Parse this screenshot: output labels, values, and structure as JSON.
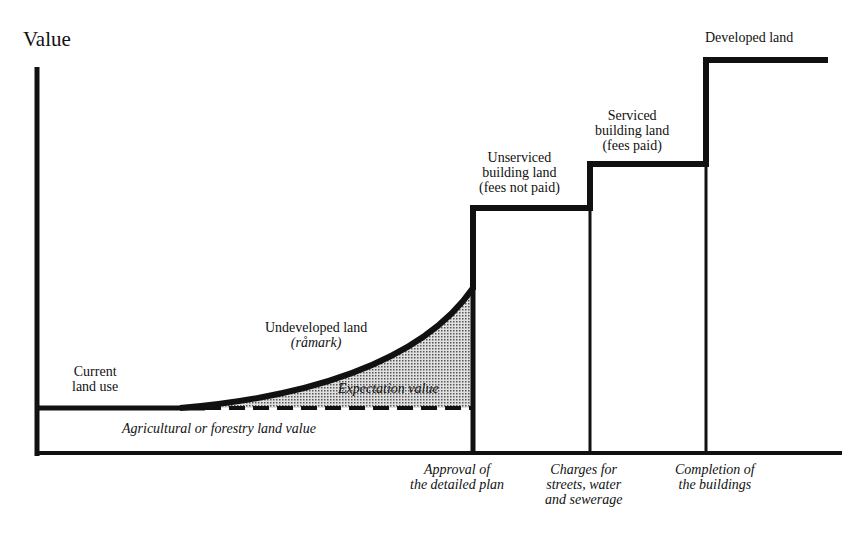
{
  "diagram": {
    "y_axis_label": "Value",
    "stages": [
      {
        "name": "current-land-use",
        "lines": [
          "Current",
          "land use"
        ]
      },
      {
        "name": "undeveloped-land",
        "lines": [
          "Undeveloped land"
        ],
        "sub": "(råmark)"
      },
      {
        "name": "unserviced-building-land",
        "lines": [
          "Unserviced",
          "building land",
          "(fees not paid)"
        ]
      },
      {
        "name": "serviced-building-land",
        "lines": [
          "Serviced",
          "building land",
          "(fees paid)"
        ]
      },
      {
        "name": "developed-land",
        "lines": [
          "Developed land"
        ]
      }
    ],
    "areas": {
      "expectation_value": "Expectation value",
      "agricultural_value": "Agricultural or forestry land value"
    },
    "events": [
      {
        "lines": [
          "Approval of",
          "the detailed plan"
        ]
      },
      {
        "lines": [
          "Charges for",
          "streets, water",
          "and sewerage"
        ]
      },
      {
        "lines": [
          "Completion of",
          "the buildings"
        ]
      }
    ],
    "colors": {
      "line": "#111111",
      "shade": "#bdbdbd",
      "background": "#ffffff"
    }
  }
}
